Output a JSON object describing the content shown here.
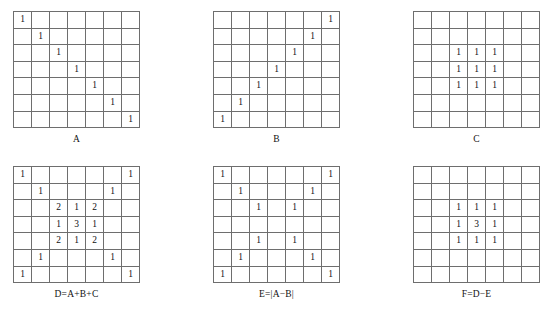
{
  "figure": {
    "rows": [
      {
        "row_name": "top-row",
        "matrices": [
          {
            "id": "A",
            "caption": "A",
            "size": 7,
            "values": [
              [
                "1",
                "",
                "",
                "",
                "",
                "",
                ""
              ],
              [
                "",
                "1",
                "",
                "",
                "",
                "",
                ""
              ],
              [
                "",
                "",
                "1",
                "",
                "",
                "",
                ""
              ],
              [
                "",
                "",
                "",
                "1",
                "",
                "",
                ""
              ],
              [
                "",
                "",
                "",
                "",
                "1",
                "",
                ""
              ],
              [
                "",
                "",
                "",
                "",
                "",
                "1",
                ""
              ],
              [
                "",
                "",
                "",
                "",
                "",
                "",
                "1"
              ]
            ]
          },
          {
            "id": "B",
            "caption": "B",
            "size": 7,
            "values": [
              [
                "",
                "",
                "",
                "",
                "",
                "",
                "1"
              ],
              [
                "",
                "",
                "",
                "",
                "",
                "1",
                ""
              ],
              [
                "",
                "",
                "",
                "",
                "1",
                "",
                ""
              ],
              [
                "",
                "",
                "",
                "1",
                "",
                "",
                ""
              ],
              [
                "",
                "",
                "1",
                "",
                "",
                "",
                ""
              ],
              [
                "",
                "1",
                "",
                "",
                "",
                "",
                ""
              ],
              [
                "1",
                "",
                "",
                "",
                "",
                "",
                ""
              ]
            ]
          },
          {
            "id": "C",
            "caption": "C",
            "size": 7,
            "values": [
              [
                "",
                "",
                "",
                "",
                "",
                "",
                ""
              ],
              [
                "",
                "",
                "",
                "",
                "",
                "",
                ""
              ],
              [
                "",
                "",
                "1",
                "1",
                "1",
                "",
                ""
              ],
              [
                "",
                "",
                "1",
                "1",
                "1",
                "",
                ""
              ],
              [
                "",
                "",
                "1",
                "1",
                "1",
                "",
                ""
              ],
              [
                "",
                "",
                "",
                "",
                "",
                "",
                ""
              ],
              [
                "",
                "",
                "",
                "",
                "",
                "",
                ""
              ]
            ]
          }
        ]
      },
      {
        "row_name": "bottom-row",
        "matrices": [
          {
            "id": "D",
            "caption": "D=A+B+C",
            "size": 7,
            "values": [
              [
                "1",
                "",
                "",
                "",
                "",
                "",
                "1"
              ],
              [
                "",
                "1",
                "",
                "",
                "",
                "1",
                ""
              ],
              [
                "",
                "",
                "2",
                "1",
                "2",
                "",
                ""
              ],
              [
                "",
                "",
                "1",
                "3",
                "1",
                "",
                ""
              ],
              [
                "",
                "",
                "2",
                "1",
                "2",
                "",
                ""
              ],
              [
                "",
                "1",
                "",
                "",
                "",
                "1",
                ""
              ],
              [
                "1",
                "",
                "",
                "",
                "",
                "",
                "1"
              ]
            ]
          },
          {
            "id": "E",
            "caption": "E=|A−B|",
            "size": 7,
            "values": [
              [
                "1",
                "",
                "",
                "",
                "",
                "",
                "1"
              ],
              [
                "",
                "1",
                "",
                "",
                "",
                "1",
                ""
              ],
              [
                "",
                "",
                "1",
                "",
                "1",
                "",
                ""
              ],
              [
                "",
                "",
                "",
                "",
                "",
                "",
                ""
              ],
              [
                "",
                "",
                "1",
                "",
                "1",
                "",
                ""
              ],
              [
                "",
                "1",
                "",
                "",
                "",
                "1",
                ""
              ],
              [
                "1",
                "",
                "",
                "",
                "",
                "",
                "1"
              ]
            ]
          },
          {
            "id": "F",
            "caption": "F=D−E",
            "size": 7,
            "values": [
              [
                "",
                "",
                "",
                "",
                "",
                "",
                ""
              ],
              [
                "",
                "",
                "",
                "",
                "",
                "",
                ""
              ],
              [
                "",
                "",
                "1",
                "1",
                "1",
                "",
                ""
              ],
              [
                "",
                "",
                "1",
                "3",
                "1",
                "",
                ""
              ],
              [
                "",
                "",
                "1",
                "1",
                "1",
                "",
                ""
              ],
              [
                "",
                "",
                "",
                "",
                "",
                "",
                ""
              ],
              [
                "",
                "",
                "",
                "",
                "",
                "",
                ""
              ]
            ]
          }
        ]
      }
    ]
  }
}
